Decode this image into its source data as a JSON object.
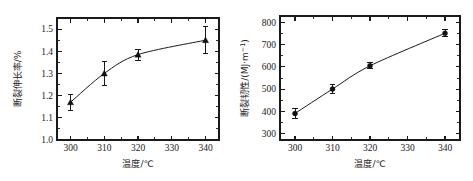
{
  "figure": {
    "background": "#ffffff",
    "axis_color": "#1a1a1a",
    "marker_color": "#111111",
    "panel_count": 2
  },
  "chart_data": [
    {
      "type": "line",
      "panel": "left",
      "title": "",
      "xlabel": "温度/℃",
      "ylabel": "断裂伸长率/%",
      "x": [
        300,
        310,
        320,
        340
      ],
      "values": [
        1.17,
        1.3,
        1.385,
        1.45
      ],
      "yerr": [
        0.035,
        0.055,
        0.025,
        0.06
      ],
      "marker": "triangle",
      "xlim": [
        296,
        344
      ],
      "ylim": [
        1.0,
        1.55
      ],
      "xticks": [
        300,
        310,
        320,
        330,
        340
      ],
      "xticklabels": [
        "300",
        "310",
        "320",
        "330",
        "340"
      ],
      "yticks": [
        1.0,
        1.1,
        1.2,
        1.3,
        1.4,
        1.5
      ],
      "yticklabels": [
        "1.0",
        "1.1",
        "1.2",
        "1.3",
        "1.4",
        "1.5"
      ],
      "x_minor_step": 5,
      "y_minor_step": 0.05,
      "grid": false,
      "legend": "none"
    },
    {
      "type": "line",
      "panel": "right",
      "title": "",
      "xlabel": "温度/℃",
      "ylabel_main": "断裂韧性/(MJ·m",
      "ylabel_sup": "−1",
      "ylabel_tail": ")",
      "ylabel": "断裂韧性/(MJ·m−1)",
      "x": [
        300,
        310,
        320,
        340
      ],
      "values": [
        390,
        500,
        605,
        752
      ],
      "yerr": [
        22,
        22,
        13,
        16
      ],
      "marker": "circle",
      "xlim": [
        296,
        344
      ],
      "ylim": [
        270,
        830
      ],
      "xticks": [
        300,
        310,
        320,
        330,
        340
      ],
      "xticklabels": [
        "300",
        "310",
        "320",
        "330",
        "340"
      ],
      "yticks": [
        300,
        400,
        500,
        600,
        700,
        800
      ],
      "yticklabels": [
        "300",
        "400",
        "500",
        "600",
        "700",
        "800"
      ],
      "x_minor_step": 5,
      "y_minor_step": 50,
      "grid": false,
      "legend": "none"
    }
  ]
}
